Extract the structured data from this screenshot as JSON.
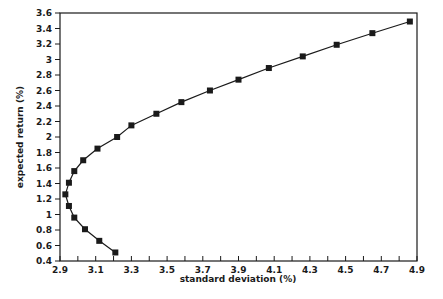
{
  "chart_data": {
    "type": "line",
    "title": "",
    "xlabel": "standard deviation (%)",
    "ylabel": "expected return (%)",
    "xlim": [
      2.9,
      4.9
    ],
    "ylim": [
      0.4,
      3.6
    ],
    "grid": false,
    "legend": null,
    "x_ticks": [
      "2.9",
      "3.1",
      "3.3",
      "3.5",
      "3.7",
      "3.9",
      "4.1",
      "4.3",
      "4.5",
      "4.7",
      "4.9"
    ],
    "y_ticks": [
      "0.4",
      "0.6",
      "0.8",
      "1",
      "1.2",
      "1.4",
      "1.6",
      "1.8",
      "2",
      "2.2",
      "2.4",
      "2.6",
      "2.8",
      "3",
      "3.2",
      "3.4",
      "3.6"
    ],
    "series": [
      {
        "name": "efficient frontier",
        "marker": "square",
        "color": "#1a1a1a",
        "points": [
          {
            "x": 3.21,
            "y": 0.51
          },
          {
            "x": 3.12,
            "y": 0.66
          },
          {
            "x": 3.04,
            "y": 0.81
          },
          {
            "x": 2.98,
            "y": 0.96
          },
          {
            "x": 2.95,
            "y": 1.11
          },
          {
            "x": 2.93,
            "y": 1.26
          },
          {
            "x": 2.95,
            "y": 1.41
          },
          {
            "x": 2.98,
            "y": 1.56
          },
          {
            "x": 3.03,
            "y": 1.7
          },
          {
            "x": 3.11,
            "y": 1.85
          },
          {
            "x": 3.22,
            "y": 2.0
          },
          {
            "x": 3.3,
            "y": 2.15
          },
          {
            "x": 3.44,
            "y": 2.3
          },
          {
            "x": 3.58,
            "y": 2.45
          },
          {
            "x": 3.74,
            "y": 2.6
          },
          {
            "x": 3.9,
            "y": 2.74
          },
          {
            "x": 4.07,
            "y": 2.89
          },
          {
            "x": 4.26,
            "y": 3.04
          },
          {
            "x": 4.45,
            "y": 3.19
          },
          {
            "x": 4.65,
            "y": 3.34
          },
          {
            "x": 4.86,
            "y": 3.49
          }
        ]
      }
    ]
  }
}
